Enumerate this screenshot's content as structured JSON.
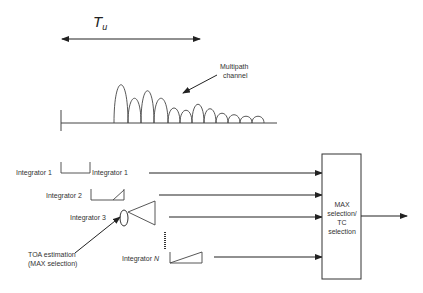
{
  "title": {
    "symbol": "T",
    "subscript": "u"
  },
  "annotations": {
    "multipath_line1": "Multipath",
    "multipath_line2": "channel",
    "toa_line1": "TOA estimation",
    "toa_line2": "(MAX selection)"
  },
  "integrators": [
    {
      "left_label": "Integrator 1",
      "right_label": "Integrator 1"
    },
    {
      "left_label": "Integrator 2"
    },
    {
      "left_label": "Integrator 3"
    },
    {
      "left_label_prefix": "Integrator ",
      "left_label_index": "N"
    }
  ],
  "selection_block": {
    "line1": "MAX",
    "line2": "selection/",
    "line3": "TC",
    "line4": "selection"
  },
  "colors": {
    "stroke": "#333333",
    "background": "#ffffff"
  }
}
